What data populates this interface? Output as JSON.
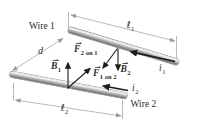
{
  "figure": {
    "wire1_label": "Wire 1",
    "wire2_label": "Wire 2",
    "length1": {
      "symbol": "ℓ",
      "sub": "1"
    },
    "length2": {
      "symbol": "ℓ",
      "sub": "2"
    },
    "separation": {
      "symbol": "d"
    },
    "current1": {
      "symbol": "i",
      "sub": "1"
    },
    "current2": {
      "symbol": "i",
      "sub": "2"
    },
    "field1": {
      "symbol": "B",
      "sub": "1",
      "hat": "⇀"
    },
    "field2": {
      "symbol": "B",
      "sub": "2",
      "hat": "⇀"
    },
    "force_2_on_1": {
      "symbol": "F",
      "sub": "2 on 1",
      "hat": "⇀"
    },
    "force_1_on_2": {
      "symbol": "F",
      "sub": "1 on 2",
      "hat": "⇀"
    },
    "colors": {
      "background": "#ffffff",
      "wire_highlight": "#f3f3f3",
      "wire_shadow": "#6e6e6e",
      "vector_arrow": "#1c1c1c",
      "dimension_line": "#9b9b9b",
      "text": "#2b2b2b"
    }
  }
}
